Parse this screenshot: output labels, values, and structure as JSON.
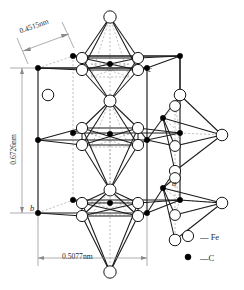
{
  "figure": {
    "kind": "crystal-structure-diagram",
    "structure_name": "cementite Fe3C orthorhombic unit cell",
    "dimensions": {
      "depth_label": "0.4515nm",
      "height_label": "0.6726nm",
      "width_label": "0.5077nm"
    },
    "axes": {
      "a": "a",
      "b": "b",
      "c": "c"
    },
    "legend": {
      "fe_symbol": "open-circle",
      "fe_label": "— Fe",
      "c_symbol": "filled-circle",
      "c_label": "—C"
    },
    "colors": {
      "line": "#1a1a1a",
      "dashed": "#9a9a9a",
      "dimension": "#7a7a7a",
      "atom_fill_fe": "#ffffff",
      "atom_fill_c": "#000000"
    },
    "cell_corners": {
      "front_top_left": [
        38,
        68
      ],
      "front_top_right": [
        147,
        68
      ],
      "back_top_left": [
        73,
        56
      ],
      "back_top_right": [
        180,
        56
      ],
      "front_bottom_left": [
        38,
        213
      ],
      "front_bottom_right": [
        147,
        213
      ],
      "back_bottom_left": [
        73,
        200
      ],
      "back_bottom_right": [
        180,
        200
      ]
    },
    "atoms": {
      "fe_count_drawn": 38,
      "c_count_drawn": 17
    }
  }
}
